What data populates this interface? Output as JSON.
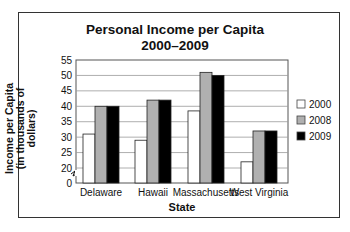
{
  "chart_data": {
    "type": "bar",
    "title": "Personal Income per Capita",
    "subtitle": "2000–2009",
    "xlabel": "State",
    "ylabel": "Income per Capita (in thousands of dollars)",
    "categories": [
      "Delaware",
      "Hawaii",
      "Massachusetts",
      "West Virginia"
    ],
    "series": [
      {
        "name": "2000",
        "color": "#ffffff",
        "values": [
          31,
          29,
          38.5,
          22
        ]
      },
      {
        "name": "2008",
        "color": "#b0b0b0",
        "values": [
          40,
          42,
          51,
          32
        ]
      },
      {
        "name": "2009",
        "color": "#000000",
        "values": [
          40,
          42,
          50,
          32
        ]
      }
    ],
    "yticks": [
      0,
      20,
      25,
      30,
      35,
      40,
      45,
      50,
      55
    ],
    "ylim": [
      0,
      55
    ],
    "axis_break": "between 0 and 20",
    "grid": true,
    "legend_position": "right"
  },
  "title_line1": "Personal Income per Capita",
  "title_line2": "2000–2009",
  "ylabel_line1": "Income per Capita",
  "ylabel_line2": "(in thousands of dollars)"
}
